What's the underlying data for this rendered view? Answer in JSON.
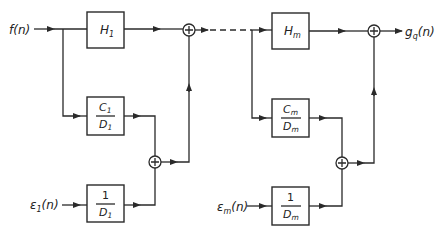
{
  "diagram": {
    "title": "",
    "type": "block-diagram",
    "stages": [
      {
        "id": "stage-1",
        "input_signal": {
          "main": "f",
          "sub": "",
          "arg": "(n)"
        },
        "error_input": {
          "main": "ε",
          "sub": "1",
          "arg": "(n)"
        },
        "blocks": {
          "H": {
            "main": "H",
            "sub": "1"
          },
          "C_over_D": {
            "num_main": "C",
            "num_sub": "1",
            "den_main": "D",
            "den_sub": "1"
          },
          "one_over_D": {
            "num": "1",
            "den_main": "D",
            "den_sub": "1"
          }
        },
        "summing_junctions": [
          "⊕",
          "⊕"
        ]
      },
      {
        "id": "stage-m",
        "error_input": {
          "main": "ε",
          "sub": "m",
          "arg": "(n)"
        },
        "output_signal": {
          "main": "g",
          "sub": "q",
          "arg": "(n)"
        },
        "blocks": {
          "H": {
            "main": "H",
            "sub": "m"
          },
          "C_over_D": {
            "num_main": "C",
            "num_sub": "m",
            "den_main": "D",
            "den_sub": "m"
          },
          "one_over_D": {
            "num": "1",
            "den_main": "D",
            "den_sub": "m"
          }
        },
        "summing_junctions": [
          "⊕",
          "⊕"
        ]
      }
    ],
    "connector": "dashed-line (stages 2 … m−1 omitted)",
    "colors": {
      "line": "#2a2a2a",
      "background": "#ffffff"
    }
  }
}
